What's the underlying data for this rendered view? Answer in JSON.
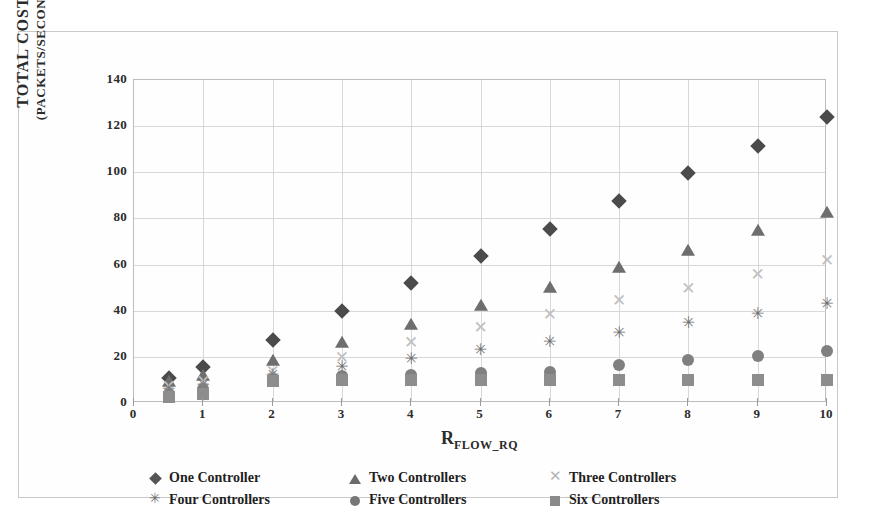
{
  "chart_data": {
    "type": "scatter",
    "title": "",
    "xlabel": "R_FLOW_RQ",
    "xlabel_base": "R",
    "xlabel_sub": "FLOW_RQ",
    "ylabel": "TOTAL COST",
    "ylabel_sub": "(PACKETS/SECOND)",
    "xlim": [
      0,
      10
    ],
    "ylim": [
      0,
      140
    ],
    "xticks": [
      0,
      1,
      2,
      3,
      4,
      5,
      6,
      7,
      8,
      9,
      10
    ],
    "yticks": [
      0,
      20,
      40,
      60,
      80,
      100,
      120,
      140
    ],
    "grid": true,
    "legend_position": "bottom",
    "series": [
      {
        "name": "One Controller",
        "marker": "diamond",
        "color": "#4b4b4b",
        "x": [
          0.5,
          1,
          2,
          3,
          4,
          5,
          6,
          7,
          8,
          9,
          10
        ],
        "values": [
          11,
          15.5,
          27.5,
          39.8,
          52,
          63.8,
          75.5,
          87.5,
          99.5,
          111.2,
          123.8
        ]
      },
      {
        "name": "Two Controllers",
        "marker": "triangle",
        "color": "#6e6e6e",
        "x": [
          0.5,
          1,
          2,
          3,
          4,
          5,
          6,
          7,
          8,
          9,
          10
        ],
        "values": [
          9,
          11.5,
          18,
          26,
          34,
          42.2,
          50,
          58.5,
          66,
          74.5,
          82.5
        ]
      },
      {
        "name": "Three Controllers",
        "marker": "cross",
        "color": "#c0c0c0",
        "x": [
          0.5,
          1,
          2,
          3,
          4,
          5,
          6,
          7,
          8,
          9,
          10
        ],
        "values": [
          7.5,
          9.5,
          14,
          20,
          26.5,
          32.8,
          38.5,
          44.5,
          50,
          56,
          62
        ]
      },
      {
        "name": "Four Controllers",
        "marker": "star",
        "color": "#6f6f6f",
        "x": [
          0.5,
          1,
          2,
          3,
          4,
          5,
          6,
          7,
          8,
          9,
          10
        ],
        "values": [
          6,
          8,
          12,
          15.5,
          19,
          22.8,
          26.5,
          30.5,
          34.5,
          38.5,
          42.8
        ]
      },
      {
        "name": "Five Controllers",
        "marker": "circle",
        "color": "#808080",
        "x": [
          0.5,
          1,
          2,
          3,
          4,
          5,
          6,
          7,
          8,
          9,
          10
        ],
        "values": [
          4,
          6,
          10.5,
          11.5,
          12,
          13,
          13.5,
          16.5,
          18.5,
          20.5,
          22.5
        ]
      },
      {
        "name": "Six Controllers",
        "marker": "square",
        "color": "#8d8d8d",
        "x": [
          0.5,
          1,
          2,
          3,
          4,
          5,
          6,
          7,
          8,
          9,
          10
        ],
        "values": [
          2.5,
          4,
          9.5,
          9.8,
          10,
          10,
          10,
          10,
          10,
          10,
          10
        ]
      }
    ]
  }
}
